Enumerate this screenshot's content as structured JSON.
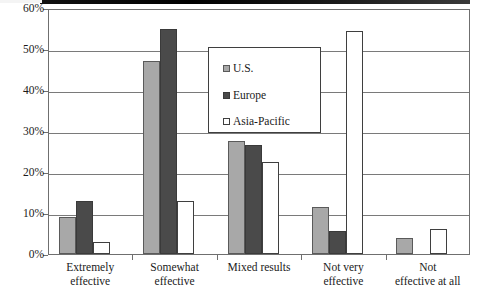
{
  "chart_data": {
    "type": "bar",
    "title": "",
    "xlabel": "",
    "ylabel": "",
    "ylim": [
      0,
      60
    ],
    "ytick_labels": [
      "0%",
      "10%",
      "20%",
      "30%",
      "40%",
      "50%",
      "60%"
    ],
    "ytick_values": [
      0,
      10,
      20,
      30,
      40,
      50,
      60
    ],
    "grid": true,
    "legend_position": "upper-center",
    "categories": [
      "Extremely effective",
      "Somewhat effective",
      "Mixed results",
      "Not very effective",
      "Not effective at all"
    ],
    "category_lines": [
      [
        "Extremely",
        "effective"
      ],
      [
        "Somewhat",
        "effective"
      ],
      [
        "Mixed results"
      ],
      [
        "Not very",
        "effective"
      ],
      [
        "Not",
        "effective at all"
      ]
    ],
    "series": [
      {
        "name": "U.S.",
        "color": "#a8a8a8",
        "values": [
          9,
          47,
          27.5,
          11.5,
          4
        ]
      },
      {
        "name": "Europe",
        "color": "#4a4a4a",
        "values": [
          13,
          55,
          26.5,
          5.5,
          0
        ]
      },
      {
        "name": "Asia-Pacific",
        "color": "#ffffff",
        "values": [
          3,
          13,
          22.5,
          54.5,
          6
        ]
      }
    ]
  },
  "legend": {
    "items": [
      {
        "label": "U.S.",
        "swatch": "us-swatch-icon"
      },
      {
        "label": "Europe",
        "swatch": "europe-swatch-icon"
      },
      {
        "label": "Asia-Pacific",
        "swatch": "asia-pacific-swatch-icon"
      }
    ]
  },
  "colors": {
    "us": "#a8a8a8",
    "europe": "#4a4a4a",
    "asia_pacific": "#ffffff",
    "axis": "#6f6f6f",
    "grid": "#7a7a7a",
    "text": "#1a1a1a"
  }
}
